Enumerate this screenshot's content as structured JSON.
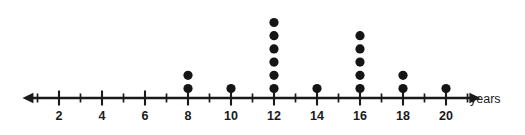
{
  "chart_data": {
    "type": "scatter",
    "plot_kind": "dot-plot",
    "title": "",
    "subtitle": "",
    "xlabel": "years",
    "ylabel": "",
    "axis_unit_label": "years",
    "categories": [
      2,
      4,
      6,
      8,
      10,
      12,
      14,
      16,
      18,
      20
    ],
    "values": [
      0,
      0,
      0,
      2,
      1,
      6,
      1,
      5,
      2,
      1
    ],
    "points": [
      {
        "x": 8,
        "count": 2
      },
      {
        "x": 10,
        "count": 1
      },
      {
        "x": 12,
        "count": 6
      },
      {
        "x": 14,
        "count": 1
      },
      {
        "x": 16,
        "count": 5
      },
      {
        "x": 18,
        "count": 2
      },
      {
        "x": 20,
        "count": 1
      }
    ],
    "tick_labels": [
      "2",
      "4",
      "6",
      "8",
      "10",
      "12",
      "14",
      "16",
      "18",
      "20"
    ],
    "major_ticks": [
      2,
      4,
      6,
      8,
      10,
      12,
      14,
      16,
      18,
      20
    ],
    "minor_ticks": [
      1,
      3,
      5,
      7,
      9,
      11,
      13,
      15,
      17,
      19,
      21
    ],
    "xlim": [
      0.3,
      21.6
    ],
    "grid": false,
    "legend": null,
    "legend_position": "none",
    "total_count": 18,
    "axis_arrows": [
      "left",
      "right"
    ],
    "colors": {
      "dot": "#151515",
      "axis": "#1a1a1a",
      "background": "#ffffff",
      "label": "#1a1a1a"
    }
  }
}
